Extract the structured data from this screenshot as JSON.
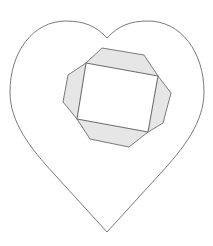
{
  "diagram": {
    "title": "",
    "colors": {
      "background": "#ffffff",
      "stroke": "#7a7a7a",
      "fill": "#e6e6e6"
    },
    "heart": {
      "notch": [
        107,
        38
      ],
      "tip": [
        107,
        232
      ],
      "left_extent": 10,
      "right_extent": 204,
      "top": 21
    },
    "octagon_points": "102,48 144,55 158,76 171,93 163,123 148,132 129,147 90,139 77,119 63,102 68,75 86,63",
    "rectangle_points": "86,63 158,76 148,132 77,119"
  }
}
